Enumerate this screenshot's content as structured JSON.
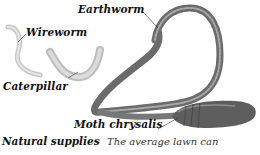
{
  "figure": {
    "labels": {
      "earthworm": "Earthworm",
      "wireworm": "Wireworm",
      "caterpillar": "Caterpillar",
      "moth_chrysalis": "Moth chrysalis"
    },
    "colors": {
      "earthworm": "#6f6f6f",
      "earthworm_highlight": "#b9b9b9",
      "wireworm": "#d6d6d6",
      "caterpillar": "#cfcfcf",
      "chrysalis": "#5a5a5a"
    }
  },
  "caption": {
    "heading": "Natural supplies",
    "text": "The average lawn can"
  }
}
